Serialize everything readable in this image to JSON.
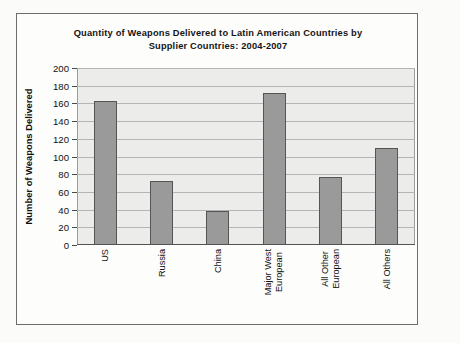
{
  "figure": {
    "title_line1": "Quantity of Weapons Delivered to Latin American Countries by",
    "title_line2": "Supplier Countries: 2004-2007",
    "frame_color": "#6d6d6d",
    "plot_background": "#ececeb",
    "bar_fill": "#9a9a9a",
    "bar_border": "#555555"
  },
  "chart_data": {
    "type": "bar",
    "title": "Quantity of Weapons Delivered to Latin American Countries by Supplier Countries: 2004-2007",
    "xlabel": "",
    "ylabel": "Number of Weapons Delivered",
    "categories": [
      "US",
      "Russia",
      "China",
      "Major West\nEuropean",
      "All Other\nEuropean",
      "All Others"
    ],
    "values": [
      163,
      72,
      39,
      172,
      77,
      110
    ],
    "ylim": [
      0,
      200
    ],
    "ytick_step": 20,
    "yticks": [
      0,
      20,
      40,
      60,
      80,
      100,
      120,
      140,
      160,
      180,
      200
    ],
    "ytick_labels": [
      "0",
      "20",
      "40",
      "60",
      "80",
      "100",
      "120",
      "140",
      "160",
      "180",
      "200"
    ],
    "grid": true,
    "legend": false,
    "legend_position": "none"
  }
}
